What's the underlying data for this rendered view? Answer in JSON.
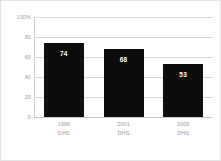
{
  "chart_data": {
    "type": "bar",
    "title": "",
    "subtitle": "",
    "xlabel": "",
    "ylabel": "",
    "categories": [
      "1996\nDHS",
      "2001\nDHS",
      "2006\nDHS"
    ],
    "category_lines": [
      {
        "year": "1996",
        "survey": "DHS"
      },
      {
        "year": "2001",
        "survey": "DHS"
      },
      {
        "year": "2006",
        "survey": "DHS"
      }
    ],
    "values": [
      74,
      68,
      53
    ],
    "value_labels": [
      "74",
      "68",
      "53"
    ],
    "ylim": [
      0,
      100
    ],
    "y_ticks": [
      0,
      20,
      40,
      60,
      80,
      100
    ],
    "y_tick_labels": [
      "0",
      "20",
      "40",
      "60",
      "80",
      "100%"
    ],
    "grid": true,
    "legend": false,
    "legend_position": "none",
    "bar_color": "#0d0d0d",
    "value_label_color": "#ffffff",
    "gridline_color": "#d9d9d9",
    "axis_text_color": "#9a9a9a",
    "background_color": "#ffffff",
    "border_color": "#e3e3e3"
  }
}
